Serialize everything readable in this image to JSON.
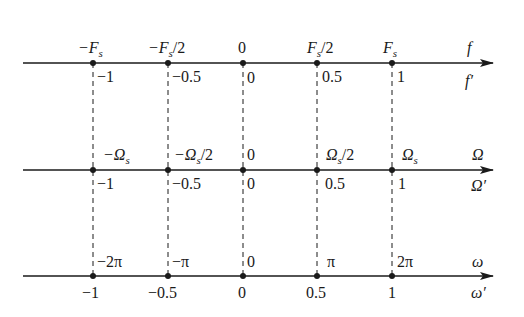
{
  "diagram": {
    "tick_x": [
      93,
      168,
      243,
      317,
      392
    ],
    "axes": [
      {
        "id": "f-axis",
        "y": 63,
        "top_name": "f",
        "bottom_name": "f′",
        "top_labels": [
          {
            "main": "−F",
            "sub": "s",
            "tail": ""
          },
          {
            "main": "−F",
            "sub": "s",
            "tail": "/2"
          },
          {
            "main": "0",
            "sub": "",
            "tail": ""
          },
          {
            "main": "F",
            "sub": "s",
            "tail": "/2"
          },
          {
            "main": "F",
            "sub": "s",
            "tail": ""
          }
        ],
        "bottom_labels": [
          "−1",
          "−0.5",
          "0",
          "0.5",
          "1"
        ]
      },
      {
        "id": "Omega-axis",
        "y": 170,
        "top_name": "Ω",
        "bottom_name": "Ω′",
        "top_labels": [
          {
            "main": "−Ω",
            "sub": "s",
            "tail": ""
          },
          {
            "main": "−Ω",
            "sub": "s",
            "tail": "/2"
          },
          {
            "main": "0",
            "sub": "",
            "tail": ""
          },
          {
            "main": "Ω",
            "sub": "s",
            "tail": "/2"
          },
          {
            "main": "Ω",
            "sub": "s",
            "tail": ""
          }
        ],
        "bottom_labels": [
          "−1",
          "−0.5",
          "0",
          "0.5",
          "1"
        ]
      },
      {
        "id": "omega-axis",
        "y": 276,
        "top_name": "ω",
        "bottom_name": "ω′",
        "top_labels": [
          {
            "main": "−2π",
            "sub": "",
            "tail": ""
          },
          {
            "main": "−π",
            "sub": "",
            "tail": ""
          },
          {
            "main": "0",
            "sub": "",
            "tail": ""
          },
          {
            "main": "π",
            "sub": "",
            "tail": ""
          },
          {
            "main": "2π",
            "sub": "",
            "tail": ""
          }
        ],
        "bottom_labels": [
          "−1",
          "−0.5",
          "0",
          "0.5",
          "1"
        ]
      }
    ],
    "colors": {
      "line": "#1a1a1a",
      "background": "#ffffff"
    }
  }
}
